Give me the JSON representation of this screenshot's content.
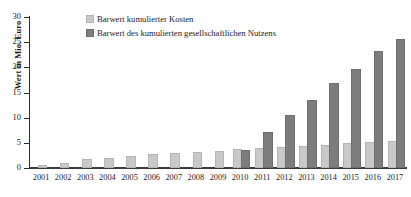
{
  "chart_data": {
    "type": "bar",
    "title": "",
    "xlabel": "",
    "ylabel": "Wert in Mio. Euro",
    "ylim": [
      0,
      30
    ],
    "yticks": [
      0,
      5,
      10,
      15,
      20,
      25,
      30
    ],
    "grid": false,
    "legend_position": "top-left",
    "categories": [
      "2001",
      "2002",
      "2003",
      "2004",
      "2005",
      "2006",
      "2007",
      "2008",
      "2009",
      "2010",
      "2011",
      "2012",
      "2013",
      "2014",
      "2015",
      "2016",
      "2017"
    ],
    "series": [
      {
        "name": "Barwert kumulierter Kosten",
        "color": "#c9c9c9",
        "values": [
          0.2,
          0.5,
          1.3,
          1.6,
          2.0,
          2.3,
          2.6,
          2.8,
          2.9,
          3.3,
          3.5,
          3.7,
          3.9,
          4.2,
          4.5,
          4.7,
          5.0
        ]
      },
      {
        "name": "Barwert des kumulierten gesellschaftlichen Nutzens",
        "color": "#7d7d7d",
        "values": [
          0,
          0,
          0,
          0,
          0,
          0,
          0,
          0,
          0,
          3.2,
          6.8,
          10.2,
          13.2,
          16.4,
          19.3,
          22.8,
          25.2
        ]
      }
    ]
  },
  "legend": {
    "items": [
      {
        "label": "Barwert kumulierter Kosten",
        "swatch": "cost-swatch"
      },
      {
        "label": "Barwert des kumulierten gesellschaftlichen Nutzens",
        "swatch": "benefit-swatch"
      }
    ]
  },
  "axes": {
    "y_title": "Wert in Mio. Euro",
    "y_tick_labels": [
      "30",
      "25",
      "20",
      "15",
      "10",
      "5",
      "0"
    ],
    "x_tick_labels": [
      "2001",
      "2002",
      "2003",
      "2004",
      "2005",
      "2006",
      "2007",
      "2008",
      "2009",
      "2010",
      "2011",
      "2012",
      "2013",
      "2014",
      "2015",
      "2016",
      "2017"
    ]
  }
}
